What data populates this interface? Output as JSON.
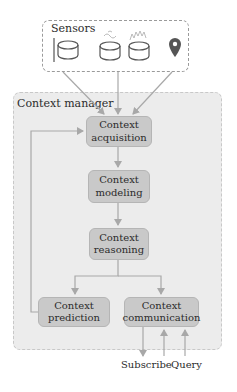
{
  "sensors": {
    "title": "Sensors",
    "icons": [
      "microphone-sensor-icon",
      "signal-sensor-icon",
      "heat-sensor-icon",
      "location-pin-icon"
    ]
  },
  "manager": {
    "title": "Context manager",
    "nodes": {
      "acquisition": {
        "line1": "Context",
        "line2": "acquisition"
      },
      "modeling": {
        "line1": "Context",
        "line2": "modeling"
      },
      "reasoning": {
        "line1": "Context",
        "line2": "reasoning"
      },
      "prediction": {
        "line1": "Context",
        "line2": "prediction"
      },
      "communication": {
        "line1": "Context",
        "line2": "communication"
      }
    }
  },
  "io": {
    "subscribe": "Subscribe",
    "query": "Query"
  },
  "colors": {
    "node_fill": "#c9c9c9",
    "manager_fill": "#ececec",
    "arrow": "#a8a8a8",
    "icon": "#555555"
  }
}
